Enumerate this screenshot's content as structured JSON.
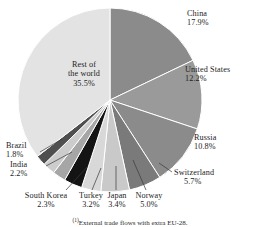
{
  "chart_data": {
    "type": "pie",
    "title": "",
    "subtitle": "",
    "xlabel": "",
    "ylabel": "",
    "legend_position": "none",
    "grid": false,
    "units": "%",
    "footnote": "External trade flows with extra EU-28.",
    "footnote_marker": "(1)",
    "categories": [
      "China",
      "United States",
      "Russia",
      "Switzerland",
      "Norway",
      "Japan",
      "Turkey",
      "South Korea",
      "India",
      "Brazil",
      "Rest of the world"
    ],
    "values": [
      17.9,
      12.2,
      10.8,
      5.7,
      5.0,
      3.4,
      3.2,
      2.3,
      2.2,
      1.8,
      35.5
    ],
    "slices": [
      {
        "label": "China",
        "value": 17.9,
        "value_text": "17.9%",
        "color": "#8b8b8b"
      },
      {
        "label": "United States",
        "value": 12.2,
        "value_text": "12.2%",
        "color": "#9a9a9a"
      },
      {
        "label": "Russia",
        "value": 10.8,
        "value_text": "10.8%",
        "color": "#8b8b8b"
      },
      {
        "label": "Switzerland",
        "value": 5.7,
        "value_text": "5.7%",
        "color": "#7a7a7a"
      },
      {
        "label": "Norway",
        "value": 5.0,
        "value_text": "5.0%",
        "color": "#c9c9c9"
      },
      {
        "label": "Japan",
        "value": 3.4,
        "value_text": "3.4%",
        "color": "#d8d8d8"
      },
      {
        "label": "Turkey",
        "value": 3.2,
        "value_text": "3.2%",
        "color": "#141414"
      },
      {
        "label": "South Korea",
        "value": 2.3,
        "value_text": "2.3%",
        "color": "#a6a6a6"
      },
      {
        "label": "India",
        "value": 2.2,
        "value_text": "2.2%",
        "color": "#cccccc"
      },
      {
        "label": "Brazil",
        "value": 1.8,
        "value_text": "1.8%",
        "color": "#4f4f4f"
      },
      {
        "label": "Rest of the world",
        "value": 35.5,
        "value_text": "35.5%",
        "color": "#e3e3e3"
      }
    ]
  },
  "labels": {
    "china": {
      "name": "China",
      "pct": "17.9%"
    },
    "united_states": {
      "name": "United States",
      "pct": "12.2%"
    },
    "russia": {
      "name": "Russia",
      "pct": "10.8%"
    },
    "switzerland": {
      "name": "Switzerland",
      "pct": "5.7%"
    },
    "norway": {
      "name": "Norway",
      "pct": "5.0%"
    },
    "japan": {
      "name": "Japan",
      "pct": "3.4%"
    },
    "turkey": {
      "name": "Turkey",
      "pct": "3.2%"
    },
    "south_korea": {
      "name": "South Korea",
      "pct": "2.3%"
    },
    "india": {
      "name": "India",
      "pct": "2.2%"
    },
    "brazil": {
      "name": "Brazil",
      "pct": "1.8%"
    },
    "rest": {
      "name_line1": "Rest of",
      "name_line2": "the world",
      "pct": "35.5%"
    }
  },
  "footnote": {
    "marker": "(1)",
    "text": "External trade flows with extra EU-28."
  },
  "colors": {
    "background": "#ffffff",
    "text": "#1d1d1d",
    "slice_border": "#ffffff",
    "leader_line": "#3a3a3a"
  }
}
